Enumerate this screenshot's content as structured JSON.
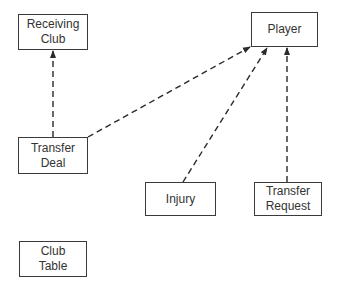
{
  "diagram": {
    "nodes": [
      {
        "id": "receiving-club",
        "label": "Receiving\nClub",
        "x": 18,
        "y": 14,
        "w": 70,
        "h": 36
      },
      {
        "id": "player",
        "label": "Player",
        "x": 251,
        "y": 12,
        "w": 67,
        "h": 35
      },
      {
        "id": "transfer-deal",
        "label": "Transfer\nDeal",
        "x": 18,
        "y": 137,
        "w": 70,
        "h": 37
      },
      {
        "id": "injury",
        "label": "Injury",
        "x": 145,
        "y": 182,
        "w": 71,
        "h": 34
      },
      {
        "id": "transfer-request",
        "label": "Transfer\nRequest",
        "x": 254,
        "y": 182,
        "w": 68,
        "h": 34
      },
      {
        "id": "club-table",
        "label": "Club\nTable",
        "x": 19,
        "y": 241,
        "w": 68,
        "h": 36
      }
    ],
    "edges": [
      {
        "from": "transfer-deal",
        "to": "receiving-club",
        "style": "dashed",
        "arrow": "end",
        "x1": 53,
        "y1": 137,
        "x2": 53,
        "y2": 51
      },
      {
        "from": "transfer-deal",
        "to": "player",
        "style": "dashed",
        "arrow": "end",
        "x1": 88,
        "y1": 137,
        "x2": 250,
        "y2": 47
      },
      {
        "from": "injury",
        "to": "player",
        "style": "dashed",
        "arrow": "end",
        "x1": 183,
        "y1": 182,
        "x2": 267,
        "y2": 48
      },
      {
        "from": "transfer-request",
        "to": "player",
        "style": "dashed",
        "arrow": "end",
        "x1": 287,
        "y1": 182,
        "x2": 287,
        "y2": 48
      }
    ],
    "colors": {
      "line": "#2a2a2a",
      "border": "#3a3a3a",
      "text": "#333333",
      "background": "#ffffff"
    }
  }
}
